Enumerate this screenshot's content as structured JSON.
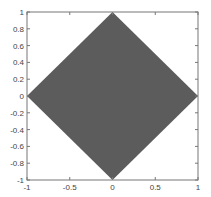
{
  "chart_data": {
    "type": "area",
    "title": "",
    "xlabel": "",
    "ylabel": "",
    "xlim": [
      -1,
      1
    ],
    "ylim": [
      -1,
      1
    ],
    "grid": false,
    "legend": null,
    "series": [
      {
        "name": "diamond",
        "fill": "#5c5c5c",
        "x": [
          1,
          0,
          -1,
          0,
          1
        ],
        "y": [
          0,
          1,
          0,
          -1,
          0
        ]
      }
    ],
    "xticks": [
      -1,
      -0.5,
      0,
      0.5,
      1
    ],
    "xtick_labels": [
      "-1",
      "-0.5",
      "0",
      "0.5",
      "1"
    ],
    "yticks": [
      1,
      0.8,
      0.6,
      0.4,
      0.2,
      0,
      -0.2,
      -0.4,
      -0.6,
      -0.8,
      -1
    ],
    "ytick_labels": [
      "1",
      "0.8",
      "0.6",
      "0.4",
      "0.2",
      "0",
      "-0.2",
      "-0.4",
      "-0.6",
      "-0.8",
      "-1"
    ]
  },
  "colors": {
    "fill": "#5c5c5c",
    "axis": "#777777",
    "text": "#444444"
  }
}
